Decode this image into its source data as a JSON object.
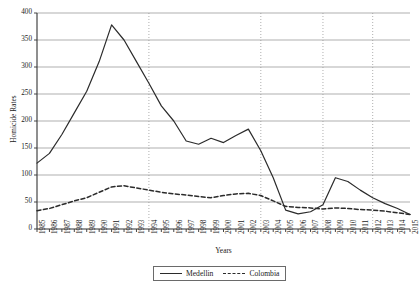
{
  "chart_data": {
    "type": "line",
    "title": "",
    "xlabel": "Years",
    "ylabel": "Homicide Rates",
    "ylim": [
      0,
      400
    ],
    "yticks": [
      0,
      50,
      100,
      150,
      200,
      250,
      300,
      350,
      400
    ],
    "grid": true,
    "grid_orientation": "horizontal",
    "legend_position": "bottom-center",
    "vertical_reference_years": [
      1994,
      2003,
      2008,
      2012
    ],
    "categories": [
      "1985",
      "1986",
      "1987",
      "1988",
      "1989",
      "1990",
      "1991",
      "1992",
      "1993",
      "1994",
      "1995",
      "1996",
      "1997",
      "1998",
      "1999",
      "2000",
      "2001",
      "2002",
      "2003",
      "2004",
      "2005",
      "2006",
      "2007",
      "2008",
      "2009",
      "2010",
      "2011",
      "2012",
      "2013",
      "2014",
      "2015"
    ],
    "series": [
      {
        "name": "Medellin",
        "style": "solid",
        "color": "#2b2b2b",
        "values": [
          122,
          140,
          175,
          215,
          255,
          310,
          378,
          350,
          310,
          270,
          228,
          200,
          163,
          157,
          168,
          160,
          173,
          185,
          145,
          95,
          35,
          28,
          32,
          45,
          95,
          88,
          72,
          58,
          47,
          38,
          27
        ]
      },
      {
        "name": "Colombia",
        "style": "dashed",
        "color": "#2b2b2b",
        "values": [
          34,
          38,
          45,
          52,
          58,
          68,
          78,
          80,
          76,
          72,
          68,
          65,
          63,
          60,
          58,
          62,
          65,
          66,
          62,
          52,
          42,
          40,
          39,
          37,
          39,
          38,
          36,
          35,
          33,
          30,
          27
        ]
      }
    ]
  },
  "legend": {
    "items": [
      {
        "label": "Medellin",
        "style": "solid"
      },
      {
        "label": "Colombia",
        "style": "dashed"
      }
    ]
  }
}
